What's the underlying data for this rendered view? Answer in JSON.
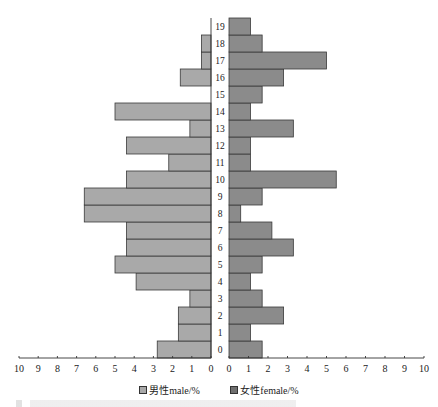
{
  "chart_data": {
    "type": "bar",
    "orientation": "horizontal",
    "style": "population-pyramid",
    "title": "",
    "categories": [
      "0",
      "1",
      "2",
      "3",
      "4",
      "5",
      "6",
      "7",
      "8",
      "9",
      "10",
      "11",
      "12",
      "13",
      "14",
      "15",
      "16",
      "17",
      "18",
      "19"
    ],
    "series": [
      {
        "name": "男性male/%",
        "side": "left",
        "color": "#a9a9a9",
        "values": [
          2.8,
          1.7,
          1.7,
          1.1,
          3.9,
          5.0,
          4.4,
          4.4,
          6.6,
          6.6,
          4.4,
          2.2,
          4.4,
          1.1,
          5.0,
          0,
          1.6,
          0.5,
          0.5,
          0
        ]
      },
      {
        "name": "女性female/%",
        "side": "right",
        "color": "#8b8b8b",
        "values": [
          1.7,
          1.1,
          2.8,
          1.7,
          1.1,
          1.7,
          3.3,
          2.2,
          0.6,
          1.7,
          5.5,
          1.1,
          1.1,
          3.3,
          1.1,
          1.7,
          2.8,
          5.0,
          1.7,
          1.1
        ]
      }
    ],
    "xlabel": "",
    "ylabel": "",
    "xlim_left": [
      10,
      0
    ],
    "xlim_right": [
      0,
      10
    ],
    "left_ticks": [
      "10",
      "9",
      "8",
      "7",
      "6",
      "5",
      "4",
      "3",
      "2",
      "1",
      "0"
    ],
    "right_ticks": [
      "0",
      "1",
      "2",
      "3",
      "4",
      "5",
      "6",
      "7",
      "8",
      "9",
      "10"
    ],
    "grid": false,
    "legend_position": "bottom"
  },
  "legend": {
    "male_label": "男性male/%",
    "female_label": "女性female/%"
  }
}
